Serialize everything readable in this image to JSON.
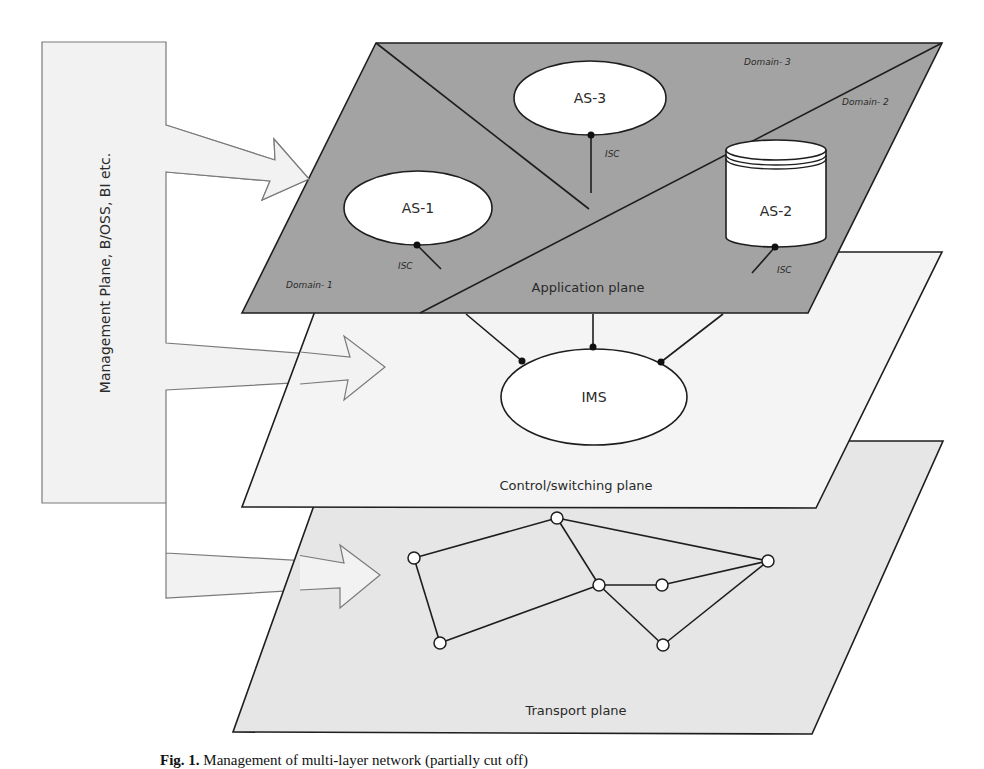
{
  "figure": {
    "caption_prefix": "Fig. 1.",
    "caption_text": "Management of multi-layer network (partially cut off)"
  },
  "colors": {
    "application_plane_fill": "#a3a3a3",
    "control_plane_fill": "#f4f4f4",
    "transport_plane_fill": "#e6e6e6",
    "management_fill": "#f2f2f2",
    "management_stroke": "#7a7a7a",
    "line": "#1e1e1e",
    "node_fill": "#ffffff"
  },
  "management": {
    "label": "Management Plane, B/OSS, BI etc.",
    "arrows": [
      "to-application-plane",
      "to-control-plane",
      "to-transport-plane"
    ]
  },
  "application_plane": {
    "label": "Application plane",
    "domains": [
      "Domain- 1",
      "Domain- 2",
      "Domain- 3"
    ],
    "servers": [
      {
        "id": "AS-1",
        "shape": "ellipse",
        "interface": "ISC"
      },
      {
        "id": "AS-2",
        "shape": "cylinder",
        "interface": "ISC"
      },
      {
        "id": "AS-3",
        "shape": "ellipse",
        "interface": "ISC"
      }
    ]
  },
  "control_plane": {
    "label": "Control/switching plane",
    "core": "IMS"
  },
  "transport_plane": {
    "label": "Transport plane",
    "nodes": [
      {
        "id": "n1",
        "x": 414,
        "y": 558
      },
      {
        "id": "n2",
        "x": 557,
        "y": 518
      },
      {
        "id": "n3",
        "x": 599,
        "y": 585
      },
      {
        "id": "n4",
        "x": 662,
        "y": 585
      },
      {
        "id": "n5",
        "x": 768,
        "y": 561
      },
      {
        "id": "n6",
        "x": 440,
        "y": 643
      },
      {
        "id": "n7",
        "x": 663,
        "y": 645
      }
    ],
    "links": [
      [
        "n1",
        "n2"
      ],
      [
        "n2",
        "n5"
      ],
      [
        "n2",
        "n3"
      ],
      [
        "n1",
        "n6"
      ],
      [
        "n6",
        "n3"
      ],
      [
        "n3",
        "n4"
      ],
      [
        "n4",
        "n5"
      ],
      [
        "n3",
        "n7"
      ],
      [
        "n7",
        "n5"
      ]
    ]
  }
}
